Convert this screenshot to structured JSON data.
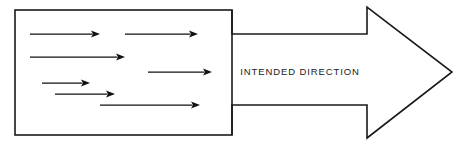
{
  "figure": {
    "name": "intended-direction-diagram",
    "type": "diagram",
    "background_color": "#ffffff",
    "line_color": "#1a1a1a",
    "fill_color": "#111111"
  },
  "big_arrow": {
    "label": "INTENDED DIRECTION",
    "label_x": 300,
    "label_y": 72,
    "shaft_top_y": 34,
    "shaft_bottom_y": 105,
    "shaft_start_x": 232,
    "head_base_x": 367,
    "head_top_y": 7,
    "head_bottom_y": 138,
    "tip_x": 452,
    "tip_y": 72
  },
  "container_box": {
    "name": "source-rectangle",
    "x": 15,
    "y": 10,
    "width": 217,
    "height": 125
  },
  "chart_data": {
    "type": "diagram",
    "title": "",
    "annotations": [
      "INTENDED DIRECTION"
    ],
    "vectors": [
      {
        "id": "vector-1",
        "x1": 30,
        "y1": 34,
        "x2": 100,
        "y2": 34
      },
      {
        "id": "vector-2",
        "x1": 125,
        "y1": 34,
        "x2": 198,
        "y2": 34
      },
      {
        "id": "vector-3",
        "x1": 30,
        "y1": 57,
        "x2": 125,
        "y2": 57
      },
      {
        "id": "vector-4",
        "x1": 148,
        "y1": 72,
        "x2": 212,
        "y2": 72
      },
      {
        "id": "vector-5",
        "x1": 42,
        "y1": 83,
        "x2": 90,
        "y2": 83
      },
      {
        "id": "vector-6",
        "x1": 55,
        "y1": 94,
        "x2": 115,
        "y2": 94
      },
      {
        "id": "vector-7",
        "x1": 100,
        "y1": 105,
        "x2": 200,
        "y2": 105
      }
    ]
  }
}
